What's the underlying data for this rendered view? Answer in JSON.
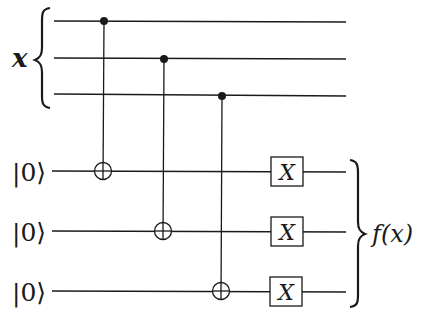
{
  "diagram": {
    "type": "quantum-circuit",
    "input_label": "x",
    "output_label": "f(x)",
    "ancilla_labels": [
      "|0⟩",
      "|0⟩",
      "|0⟩"
    ],
    "gate_label": "X",
    "input_wires": 3,
    "ancilla_wires": 3,
    "cnots": [
      {
        "control": 0,
        "target": 0
      },
      {
        "control": 1,
        "target": 1
      },
      {
        "control": 2,
        "target": 2
      }
    ],
    "colors": {
      "ink": "#1a1a1a",
      "background": "#ffffff"
    }
  }
}
